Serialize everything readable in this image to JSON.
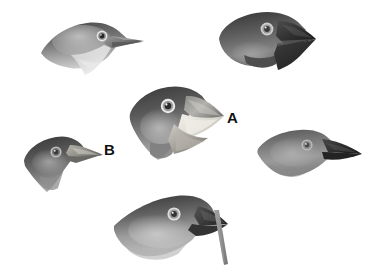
{
  "figure": {
    "background_color": "#ffffff",
    "width": 380,
    "height": 275,
    "style": "grayscale scientific illustration",
    "labels": [
      {
        "id": "A",
        "text": "A",
        "x": 227,
        "y": 110,
        "color": "#111111",
        "points_to": "center-finch-large-beak-open"
      },
      {
        "id": "B",
        "text": "B",
        "x": 104,
        "y": 142,
        "color": "#111111",
        "points_to": "left-middle-finch-pointed-beak"
      }
    ],
    "specimens": [
      {
        "id": "top-left",
        "name": "top-left-finch",
        "description": "Small finch head facing right with a short conical beak and pale throat",
        "x": 38,
        "y": 14,
        "width": 110,
        "height": 62,
        "beak": "short-conical",
        "crown_tone": "#6a6a6a",
        "cheek_tone": "#9d9d9d",
        "throat_tone": "#cfcfcf",
        "beak_tone": "#7a7a7a",
        "eye_ring": "#e8e8e8",
        "pupil": "#2b2b2b"
      },
      {
        "id": "top-right",
        "name": "top-right-finch",
        "description": "Large ground finch head facing right with a very deep heavy black beak",
        "x": 216,
        "y": 8,
        "width": 112,
        "height": 72,
        "beak": "deep-heavy",
        "crown_tone": "#555555",
        "cheek_tone": "#777777",
        "throat_tone": "#5e5e5e",
        "beak_tone": "#2e2e2e",
        "eye_ring": "#e2e2e2",
        "pupil": "#3a3a3a"
      },
      {
        "id": "center-a",
        "name": "center-finch-large-beak-open",
        "description": "Finch head facing right with a large open beak showing pale mandible interior",
        "x": 128,
        "y": 84,
        "width": 108,
        "height": 80,
        "beak": "large-open",
        "crown_tone": "#4f4f4f",
        "cheek_tone": "#7d7d7d",
        "throat_tone": "#a8a8a8",
        "beak_tone": "#8e8e8e",
        "beak_inner_tone": "#e6e4de",
        "eye_ring": "#efefef",
        "pupil": "#2a2a2a"
      },
      {
        "id": "left-b",
        "name": "left-middle-finch-pointed-beak",
        "description": "Dark finch head facing right with a slim sharply pointed beak",
        "x": 22,
        "y": 132,
        "width": 84,
        "height": 62,
        "beak": "slim-pointed",
        "crown_tone": "#4a4a4a",
        "cheek_tone": "#6f6f6f",
        "throat_tone": "#9a9a9a",
        "beak_tone": "#9a9a9a",
        "eye_ring": "#d8d8d8",
        "pupil": "#3c3c3c"
      },
      {
        "id": "right-warbler",
        "name": "right-middle-finch-warbler",
        "description": "Warbler finch head facing right with a thin straight dark pointed beak",
        "x": 256,
        "y": 126,
        "width": 110,
        "height": 56,
        "beak": "thin-straight",
        "crown_tone": "#6b6b6b",
        "cheek_tone": "#8d8d8d",
        "throat_tone": "#a6a6a6",
        "beak_tone": "#2d2d2d",
        "eye_ring": "#cfcfcf",
        "pupil": "#4a4a4a"
      },
      {
        "id": "bottom-tool",
        "name": "bottom-finch-with-tool",
        "description": "Woodpecker finch head facing right holding a cactus spine twig tool in its beak",
        "x": 112,
        "y": 192,
        "width": 128,
        "height": 82,
        "beak": "straight-stout",
        "crown_tone": "#4d4d4d",
        "cheek_tone": "#8a8a8a",
        "throat_tone": "#b4b4b4",
        "beak_tone": "#3a3a3a",
        "eye_ring": "#e0e0e0",
        "pupil": "#333333",
        "tool": {
          "name": "cactus-spine-tool",
          "tone": "#8c8c8c",
          "description": "slender twig angled down and to the right from the beak tip"
        }
      }
    ]
  }
}
